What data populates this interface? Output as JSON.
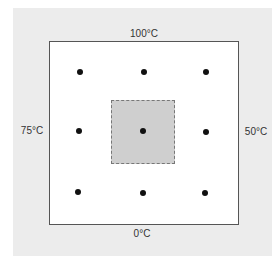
{
  "diagram": {
    "title": "",
    "boundary_labels": {
      "top": "100°C",
      "left": "75°C",
      "right": "50°C",
      "bottom": "0°C"
    },
    "grid_points": [
      {
        "row": 0,
        "col": 0,
        "x": 80,
        "y": 72
      },
      {
        "row": 0,
        "col": 1,
        "x": 144,
        "y": 72
      },
      {
        "row": 0,
        "col": 2,
        "x": 206,
        "y": 72
      },
      {
        "row": 1,
        "col": 0,
        "x": 79,
        "y": 131
      },
      {
        "row": 1,
        "col": 1,
        "x": 143,
        "y": 131
      },
      {
        "row": 1,
        "col": 2,
        "x": 206,
        "y": 132
      },
      {
        "row": 2,
        "col": 0,
        "x": 78,
        "y": 192
      },
      {
        "row": 2,
        "col": 1,
        "x": 143,
        "y": 193
      },
      {
        "row": 2,
        "col": 2,
        "x": 205,
        "y": 193
      }
    ],
    "highlighted_cell": {
      "row": 1,
      "col": 1
    },
    "colors": {
      "panel": "#ececec",
      "plate": "#ffffff",
      "highlight": "#cfcfcf",
      "dot": "#111111"
    }
  }
}
